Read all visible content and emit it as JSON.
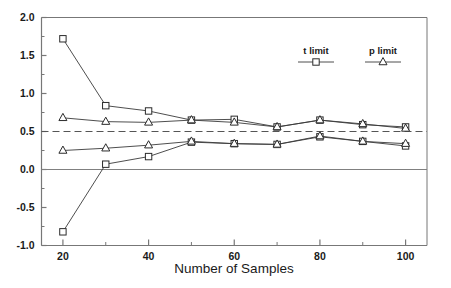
{
  "chart_data": {
    "type": "line",
    "title": "",
    "xlabel": "Number of Samples",
    "ylabel": "",
    "xlim": [
      15,
      105
    ],
    "ylim": [
      -1.0,
      2.0
    ],
    "grid": false,
    "legend_position": "top-right",
    "x": [
      20,
      30,
      40,
      50,
      60,
      70,
      80,
      90,
      100
    ],
    "xticks": [
      "20",
      "40",
      "60",
      "80",
      "100"
    ],
    "xtick_values": [
      20,
      40,
      60,
      80,
      100
    ],
    "xminor_values": [
      30,
      50,
      70,
      90
    ],
    "yticks": [
      "2.0",
      "1.5",
      "1.0",
      "0.5",
      "0.0",
      "-0.5",
      "-1.0"
    ],
    "ytick_values": [
      2.0,
      1.5,
      1.0,
      0.5,
      0.0,
      -0.5,
      -1.0
    ],
    "yminor_values": [
      1.75,
      1.25,
      0.75,
      0.25,
      -0.25,
      -0.75
    ],
    "reference_lines": [
      {
        "name": "dashed-reference-0.5",
        "y": 0.5,
        "style": "dashed",
        "color": "#555555"
      },
      {
        "name": "solid-reference-0.0",
        "y": 0.0,
        "style": "solid",
        "color": "#808080"
      }
    ],
    "series": [
      {
        "name": "t limit upper",
        "legend": "t limit",
        "marker": "square",
        "values": [
          1.72,
          0.84,
          0.77,
          0.65,
          0.66,
          0.56,
          0.65,
          0.59,
          0.56
        ]
      },
      {
        "name": "t limit lower",
        "legend": "t limit",
        "marker": "square",
        "values": [
          -0.82,
          0.07,
          0.17,
          0.36,
          0.34,
          0.33,
          0.43,
          0.37,
          0.31
        ]
      },
      {
        "name": "p limit upper",
        "legend": "p limit",
        "marker": "triangle",
        "values": [
          0.68,
          0.63,
          0.62,
          0.65,
          0.62,
          0.56,
          0.65,
          0.6,
          0.54
        ]
      },
      {
        "name": "p limit lower",
        "legend": "p limit",
        "marker": "triangle",
        "values": [
          0.25,
          0.28,
          0.32,
          0.37,
          0.34,
          0.33,
          0.44,
          0.37,
          0.34
        ]
      }
    ],
    "legend_entries": [
      {
        "label": "t limit",
        "marker": "square"
      },
      {
        "label": "p limit",
        "marker": "triangle"
      }
    ],
    "colors": {
      "line": "#3a3a3a",
      "marker_stroke": "#2b2b2b",
      "marker_fill": "#ffffff",
      "axis": "#777777",
      "text": "#1a1a1a",
      "reference_dashed": "#555555",
      "reference_solid": "#808080",
      "background": "#ffffff"
    }
  }
}
